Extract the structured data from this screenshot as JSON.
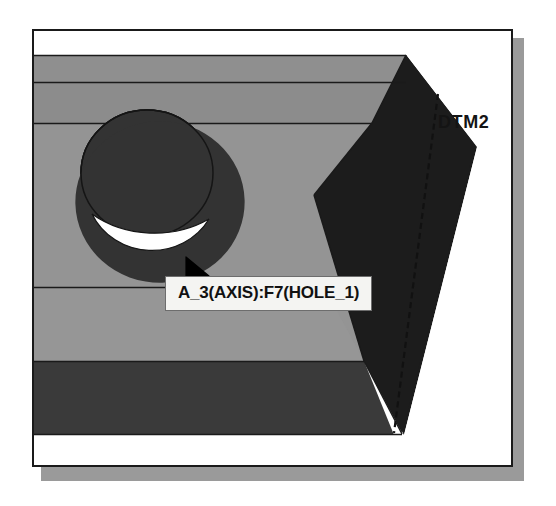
{
  "window": {
    "name": "cad-graphics-window",
    "background_color": "#ffffff",
    "border_color": "#1a1a1a",
    "shadow_color": "#9a9a9a"
  },
  "model": {
    "name": "3d-solid-block-with-hole",
    "face_colors": {
      "top_face": "#8f8f8f",
      "front_face": "#8a8a8a",
      "mid_face": "#949494",
      "lower_band": "#3a3a3a",
      "side_face": "#1c1c1c",
      "hole_bore": "#333333",
      "hole_highlight": "#ffffff",
      "edge_line": "#1a1a1a"
    }
  },
  "annotations": {
    "datum_plane_label": "DTM2",
    "datum_plane_line_style": "dashed"
  },
  "tooltip": {
    "text": "A_3(AXIS):F7(HOLE_1)",
    "background": "#f4f4f2",
    "border": "#6d6d6d",
    "text_color": "#111111"
  },
  "cursor": {
    "icon": "arrow-pointer",
    "color": "#000000",
    "x": 160,
    "y": 232
  }
}
